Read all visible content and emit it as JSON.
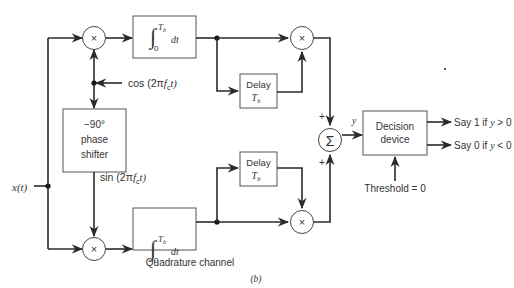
{
  "diagram": {
    "input_label": "x(t)",
    "multiplier_symbol": "×",
    "summer_symbol": "Σ",
    "inphase": {
      "carrier_label": "cos (2πf_c t)",
      "carrier_text": "cos (2π",
      "carrier_f": "f",
      "carrier_sub": "c",
      "carrier_t": "t)",
      "integrator_upper": "T",
      "integrator_upper_sub": "b",
      "integrator_lower": "0",
      "integrator_dt": "dt",
      "delay_label": "Delay",
      "delay_T": "T",
      "delay_sub": "b"
    },
    "phase_shifter": {
      "line1": "−90°",
      "line2": "phase",
      "line3": "shifter"
    },
    "quadrature": {
      "carrier_label": "sin (2πf_c t)",
      "carrier_text": "sin (2π",
      "carrier_f": "f",
      "carrier_sub": "c",
      "carrier_t": "t)",
      "integrator_upper": "T",
      "integrator_upper_sub": "b",
      "integrator_lower": "0",
      "integrator_dt": "dt",
      "delay_label": "Delay",
      "delay_T": "T",
      "delay_sub": "b",
      "channel_label": "Quadrature channel"
    },
    "summer": {
      "plus_top": "+",
      "plus_bottom": "+",
      "output_label": "y"
    },
    "decision": {
      "line1": "Decision",
      "line2": "device",
      "threshold_label": "Threshold = 0",
      "out1_text": "Say 1 if ",
      "out1_var": "y",
      "out1_cond": " > 0",
      "out0_text": "Say 0 if ",
      "out0_var": "y",
      "out0_cond": " < 0"
    },
    "caption": "(b)"
  }
}
